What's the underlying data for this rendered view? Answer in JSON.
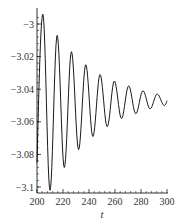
{
  "chart_data": {
    "type": "line",
    "title": "",
    "xlabel": "t",
    "ylabel": "",
    "xlim": [
      200,
      300
    ],
    "ylim": [
      -3.104,
      -2.99
    ],
    "x_ticks": [
      200,
      220,
      240,
      260,
      280,
      300
    ],
    "x_tick_labels": [
      "200",
      "220",
      "240",
      "260",
      "280",
      "300"
    ],
    "y_ticks": [
      -3,
      -3.02,
      -3.04,
      -3.06,
      -3.08,
      -3.1
    ],
    "y_tick_labels": [
      "-3",
      "-3.02",
      "-3.04",
      "-3.06",
      "-3.08",
      "-3.1"
    ],
    "grid": false,
    "legend": "none",
    "line_color": "#000000",
    "series": [
      {
        "name": "damped oscillation",
        "description": "Damped sinusoidal oscillation around about -3.047 with period about 11 and decaying amplitude",
        "center": -3.047,
        "initial_amplitude": 0.054,
        "period": 11,
        "x_start": 200,
        "x_end": 300,
        "y_start": -3.085,
        "peaks": [
          {
            "x": 204.5,
            "y": -2.994
          },
          {
            "x": 215.5,
            "y": -3.007
          },
          {
            "x": 226.5,
            "y": -3.017
          },
          {
            "x": 237.5,
            "y": -3.025
          },
          {
            "x": 248.5,
            "y": -3.031
          },
          {
            "x": 259.5,
            "y": -3.035
          },
          {
            "x": 270.5,
            "y": -3.038
          },
          {
            "x": 281.5,
            "y": -3.041
          },
          {
            "x": 292.5,
            "y": -3.043
          }
        ],
        "troughs": [
          {
            "x": 210,
            "y": -3.102
          },
          {
            "x": 221,
            "y": -3.088
          },
          {
            "x": 232,
            "y": -3.077
          },
          {
            "x": 243,
            "y": -3.069
          },
          {
            "x": 254,
            "y": -3.063
          },
          {
            "x": 265,
            "y": -3.058
          },
          {
            "x": 276,
            "y": -3.055
          },
          {
            "x": 287,
            "y": -3.052
          },
          {
            "x": 298,
            "y": -3.05
          }
        ],
        "y_end": -3.047
      }
    ]
  }
}
